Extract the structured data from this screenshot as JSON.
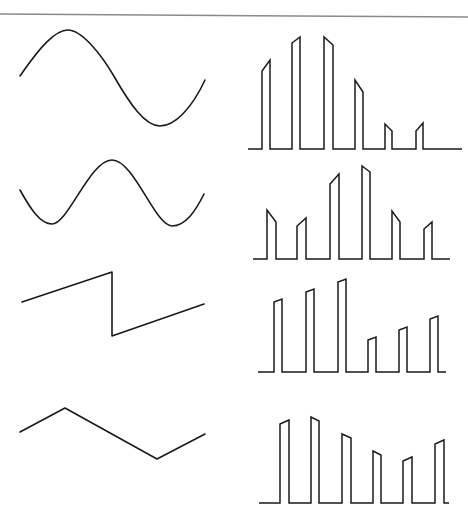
{
  "diagram": {
    "stroke_color": "#1a1a1a",
    "border_color": "#8a8a8a",
    "border": {
      "x1": 0,
      "y1": 14,
      "x2": 468,
      "y2": 17
    },
    "rows": [
      {
        "name": "sine-wave",
        "waveform": "sine",
        "analog_path": "M20,76 C40,47 55,30 68,30 C81,30 100,52 115,78 C130,104 145,126 160,126 C175,126 192,108 205,80",
        "pam": {
          "baseline_y": 149,
          "baseline_x": [
            248,
            462
          ],
          "pulses": [
            {
              "x1": 262,
              "x2": 270,
              "top_left": 71,
              "top_right": 60
            },
            {
              "x1": 292,
              "x2": 300,
              "top_left": 43,
              "top_right": 37
            },
            {
              "x1": 324,
              "x2": 333,
              "top_left": 37,
              "top_right": 45
            },
            {
              "x1": 355,
              "x2": 363,
              "top_left": 80,
              "top_right": 92
            },
            {
              "x1": 385,
              "x2": 392,
              "top_left": 124,
              "top_right": 131
            },
            {
              "x1": 416,
              "x2": 423,
              "top_left": 131,
              "top_right": 123
            }
          ]
        }
      },
      {
        "name": "high-frequency-sine-wave",
        "waveform": "sine (higher frequency)",
        "analog_path": "M20,190 C30,208 40,224 52,224 C68,224 90,160 112,160 C134,160 155,226 172,226 C186,226 196,210 204,194",
        "pam": {
          "baseline_y": 259,
          "baseline_x": [
            253,
            450
          ],
          "pulses": [
            {
              "x1": 267,
              "x2": 276,
              "top_left": 210,
              "top_right": 222
            },
            {
              "x1": 297,
              "x2": 306,
              "top_left": 226,
              "top_right": 218
            },
            {
              "x1": 330,
              "x2": 339,
              "top_left": 184,
              "top_right": 174
            },
            {
              "x1": 362,
              "x2": 370,
              "top_left": 166,
              "top_right": 172
            },
            {
              "x1": 392,
              "x2": 400,
              "top_left": 211,
              "top_right": 222
            },
            {
              "x1": 424,
              "x2": 432,
              "top_left": 229,
              "top_right": 222
            }
          ]
        }
      },
      {
        "name": "sawtooth-wave",
        "waveform": "sawtooth",
        "analog_path": "M22,302 L112,272 L112,336 L204,304",
        "pam": {
          "baseline_y": 372,
          "baseline_x": [
            258,
            446
          ],
          "pulses": [
            {
              "x1": 274,
              "x2": 282,
              "top_left": 302,
              "top_right": 299
            },
            {
              "x1": 306,
              "x2": 314,
              "top_left": 292,
              "top_right": 289
            },
            {
              "x1": 338,
              "x2": 346,
              "top_left": 282,
              "top_right": 279
            },
            {
              "x1": 368,
              "x2": 376,
              "top_left": 340,
              "top_right": 337
            },
            {
              "x1": 399,
              "x2": 407,
              "top_left": 330,
              "top_right": 327
            },
            {
              "x1": 430,
              "x2": 438,
              "top_left": 319,
              "top_right": 316
            }
          ]
        }
      },
      {
        "name": "triangle-wave",
        "waveform": "triangle",
        "analog_path": "M20,432 L65,408 L157,459 L205,434",
        "pam": {
          "baseline_y": 503,
          "baseline_x": [
            259,
            449
          ],
          "pulses": [
            {
              "x1": 280,
              "x2": 289,
              "top_left": 424,
              "top_right": 420
            },
            {
              "x1": 311,
              "x2": 319,
              "top_left": 417,
              "top_right": 421
            },
            {
              "x1": 342,
              "x2": 351,
              "top_left": 434,
              "top_right": 438
            },
            {
              "x1": 373,
              "x2": 381,
              "top_left": 451,
              "top_right": 455
            },
            {
              "x1": 403,
              "x2": 412,
              "top_left": 461,
              "top_right": 457
            },
            {
              "x1": 435,
              "x2": 444,
              "top_left": 444,
              "top_right": 440
            }
          ]
        }
      }
    ]
  }
}
